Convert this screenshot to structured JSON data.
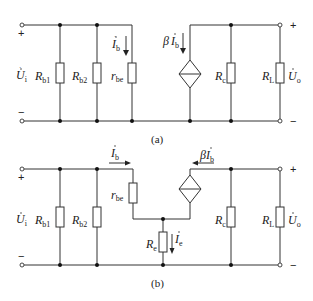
{
  "circuit_a": {
    "caption": "(a)",
    "input_plus": "+",
    "input_minus": "−",
    "output_plus": "+",
    "output_minus": "−",
    "input_voltage": {
      "main": "U",
      "sub": "i"
    },
    "output_voltage": {
      "main": "U",
      "sub": "o"
    },
    "rb1": {
      "main": "R",
      "sub": "b1"
    },
    "rb2": {
      "main": "R",
      "sub": "b2"
    },
    "rbe": {
      "main": "r",
      "sub": "be"
    },
    "rc": {
      "main": "R",
      "sub": "c"
    },
    "rl": {
      "main": "R",
      "sub": "L"
    },
    "base_current": {
      "main": "I",
      "sub": "b"
    },
    "source_current": {
      "prefix": "β",
      "main": "I",
      "sub": "b"
    }
  },
  "circuit_b": {
    "caption": "(b)",
    "input_plus": "+",
    "input_minus": "−",
    "output_plus": "+",
    "output_minus": "−",
    "input_voltage": {
      "main": "U",
      "sub": "i"
    },
    "output_voltage": {
      "main": "U",
      "sub": "o"
    },
    "rb1": {
      "main": "R",
      "sub": "b1"
    },
    "rb2": {
      "main": "R",
      "sub": "b2"
    },
    "rbe": {
      "main": "r",
      "sub": "be"
    },
    "re": {
      "main": "R",
      "sub": "e"
    },
    "rc": {
      "main": "R",
      "sub": "c"
    },
    "rl": {
      "main": "R",
      "sub": "L"
    },
    "base_current": {
      "main": "I",
      "sub": "b"
    },
    "emitter_current": {
      "main": "I",
      "sub": "e"
    },
    "source_current": {
      "prefix": "β",
      "main": "I",
      "sub": "b"
    }
  }
}
